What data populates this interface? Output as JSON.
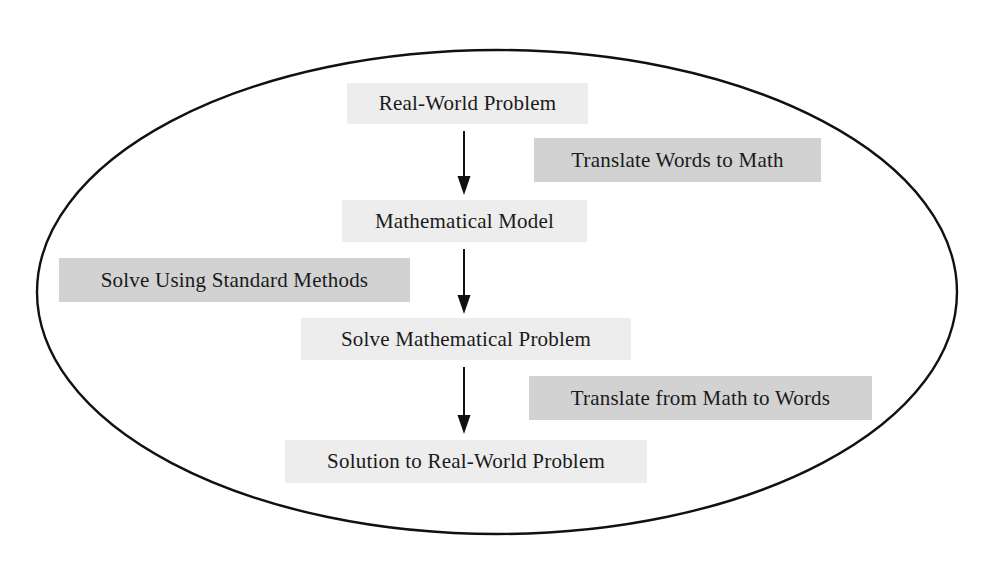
{
  "diagram": {
    "type": "flowchart",
    "enclosure": "ellipse",
    "colors": {
      "step_box": "#ededed",
      "action_box": "#d2d2d2",
      "stroke": "#111111",
      "text": "#1a1a1a"
    },
    "steps": [
      {
        "label": "Real-World Problem",
        "x": 347,
        "y": 83,
        "w": 241,
        "h": 41
      },
      {
        "label": "Mathematical Model",
        "x": 342,
        "y": 200,
        "w": 245,
        "h": 42
      },
      {
        "label": "Solve Mathematical Problem",
        "x": 301,
        "y": 318,
        "w": 330,
        "h": 42
      },
      {
        "label": "Solution to Real-World Problem",
        "x": 285,
        "y": 440,
        "w": 362,
        "h": 43
      }
    ],
    "actions": [
      {
        "label": "Translate Words to Math",
        "x": 534,
        "y": 138,
        "w": 287,
        "h": 44
      },
      {
        "label": "Solve Using Standard Methods",
        "x": 59,
        "y": 258,
        "w": 351,
        "h": 44
      },
      {
        "label": "Translate from Math to Words",
        "x": 529,
        "y": 376,
        "w": 343,
        "h": 44
      }
    ],
    "arrows": [
      {
        "from": "Real-World Problem",
        "to": "Mathematical Model",
        "x": 464,
        "y1": 131,
        "y2": 194
      },
      {
        "from": "Mathematical Model",
        "to": "Solve Mathematical Problem",
        "x": 464,
        "y1": 249,
        "y2": 313
      },
      {
        "from": "Solve Mathematical Problem",
        "to": "Solution to Real-World Problem",
        "x": 464,
        "y1": 367,
        "y2": 433
      }
    ]
  }
}
